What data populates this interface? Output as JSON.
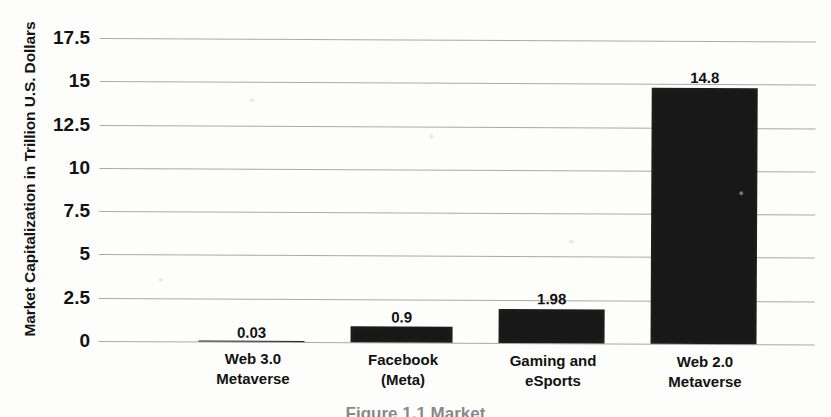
{
  "chart_data": {
    "type": "bar",
    "title": "",
    "subtitle": "",
    "xlabel": "",
    "ylabel": "Market Capitalization in Trillion U.S. Dollars",
    "categories": [
      "Web 3.0 Metaverse",
      "Facebook (Meta)",
      "Gaming and eSports",
      "Web 2.0 Metaverse"
    ],
    "category_lines": [
      [
        "Web 3.0",
        "Metaverse"
      ],
      [
        "Facebook",
        "(Meta)"
      ],
      [
        "Gaming and",
        "eSports"
      ],
      [
        "Web 2.0",
        "Metaverse"
      ]
    ],
    "values": [
      0.03,
      0.9,
      1.98,
      14.8
    ],
    "value_labels": [
      "0.03",
      "0.9",
      "1.98",
      "14.8"
    ],
    "ylim": [
      0,
      17.5
    ],
    "yticks": [
      17.5,
      15,
      12.5,
      10,
      7.5,
      5,
      2.5,
      0
    ],
    "ytick_labels": [
      "17.5",
      "15",
      "12.5",
      "10",
      "7.5",
      "5",
      "2.5",
      "0"
    ],
    "grid": true,
    "grid_axis": "y",
    "legend": false,
    "legend_position": "none",
    "bar_color": "#181818",
    "grid_color": "#9a9a9a",
    "text_color": "#121212",
    "background_color": "#fdfdfb"
  },
  "caption": {
    "text": "Figure 1.1 Market"
  }
}
